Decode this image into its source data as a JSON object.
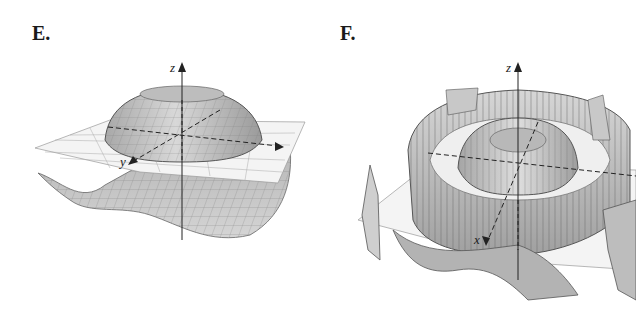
{
  "figure": {
    "panels": [
      {
        "label": "E.",
        "axes": {
          "z": "z",
          "x": "x",
          "y": "y"
        },
        "description": "3D surface: central raised dome with rim, surrounding wavy trough below a gridded xy-plane"
      },
      {
        "label": "F.",
        "axes": {
          "z": "z",
          "x": "x",
          "y": "y"
        },
        "description": "3D surface: central dome inside an oscillating ring wall with jagged sampling artifacts, intersecting gridded xy-plane"
      }
    ],
    "colors": {
      "surface_fill": "#c9c9c9",
      "surface_dark": "#6e6e6e",
      "grid_line": "#8a8a8a",
      "plane_fill": "#f4f4f4",
      "axis": "#222222"
    }
  }
}
